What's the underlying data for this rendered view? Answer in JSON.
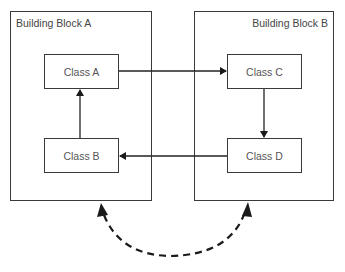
{
  "diagram": {
    "blocks": [
      {
        "id": "A",
        "label": "Building Block A"
      },
      {
        "id": "B",
        "label": "Building Block B"
      }
    ],
    "classes": [
      {
        "id": "A",
        "label": "Class A",
        "block": "A"
      },
      {
        "id": "B",
        "label": "Class B",
        "block": "A"
      },
      {
        "id": "C",
        "label": "Class C",
        "block": "B"
      },
      {
        "id": "D",
        "label": "Class D",
        "block": "B"
      }
    ],
    "edges": [
      {
        "from": "Class A",
        "to": "Class C",
        "style": "solid"
      },
      {
        "from": "Class C",
        "to": "Class D",
        "style": "solid"
      },
      {
        "from": "Class D",
        "to": "Class B",
        "style": "solid"
      },
      {
        "from": "Class B",
        "to": "Class A",
        "style": "solid"
      },
      {
        "from": "Building Block A",
        "to": "Building Block B",
        "style": "dashed",
        "bidirectional": true
      }
    ]
  }
}
